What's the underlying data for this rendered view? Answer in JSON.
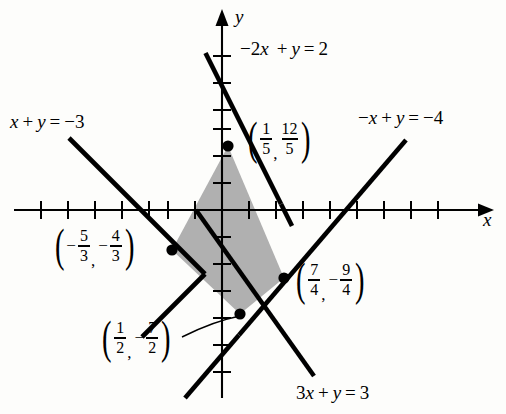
{
  "figure": {
    "type": "linear-inequality-region",
    "axes": {
      "x_label": "x",
      "y_label": "y",
      "origin_px": [
        222,
        210
      ],
      "px_per_unit": 27,
      "x_range": [
        -8.2,
        10.2
      ],
      "y_range": [
        -7.4,
        7.3
      ],
      "tick_spacing": 1,
      "x_ticks": [
        -7,
        -6,
        -5,
        -4,
        -3,
        -2,
        -1,
        1,
        2,
        3,
        4,
        5,
        6,
        7
      ],
      "y_ticks": [
        -7,
        -6,
        -5,
        -4,
        -3,
        -2,
        -1,
        1,
        2,
        3,
        4,
        5,
        6
      ],
      "grid": false,
      "arrowheads": [
        "x-positive",
        "y-positive"
      ]
    },
    "lines": [
      {
        "id": "line-minus2x-plus-y",
        "equation_text": "-2x + y = 2",
        "parts": [
          "−",
          "2",
          "x",
          "+",
          "y",
          "=",
          "2"
        ],
        "a": -2,
        "b": 1,
        "c": 2,
        "slope": 2,
        "intercept": 2,
        "label_position": "top-center"
      },
      {
        "id": "line-x-plus-y",
        "equation_text": "x + y = -3",
        "parts": [
          "x",
          "+",
          "y",
          "=",
          "−3"
        ],
        "a": 1,
        "b": 1,
        "c": -3,
        "slope": -1,
        "intercept": -3,
        "label_position": "upper-left"
      },
      {
        "id": "line-minusx-plus-y",
        "equation_text": "-x + y = -4",
        "parts": [
          "−",
          "x",
          "+",
          "y",
          "=",
          "−4"
        ],
        "a": -1,
        "b": 1,
        "c": -4,
        "slope": 1,
        "intercept": -4,
        "label_position": "upper-right"
      },
      {
        "id": "line-3x-plus-y",
        "equation_text": "3x + y = 3",
        "parts": [
          "3",
          "x",
          "+",
          "y",
          "=",
          "3"
        ],
        "a": 3,
        "b": 1,
        "c": 3,
        "slope": -3,
        "intercept": 3,
        "label_position": "bottom-right"
      }
    ],
    "vertices": [
      {
        "id": "vertex-top",
        "x": 0.2,
        "y": 2.4,
        "x_frac": {
          "sign": "",
          "num": "1",
          "den": "5"
        },
        "y_frac": {
          "sign": "",
          "num": "12",
          "den": "5"
        },
        "label_text": "(1/5, 12/5)",
        "px": [
          228,
          146
        ]
      },
      {
        "id": "vertex-left",
        "x": -1.6667,
        "y": -1.3333,
        "x_frac": {
          "sign": "−",
          "num": "5",
          "den": "3"
        },
        "y_frac": {
          "sign": "−",
          "num": "4",
          "den": "3"
        },
        "label_text": "(-5/3, -4/3)",
        "px": [
          172,
          250
        ]
      },
      {
        "id": "vertex-right",
        "x": 1.75,
        "y": -2.25,
        "x_frac": {
          "sign": "",
          "num": "7",
          "den": "4"
        },
        "y_frac": {
          "sign": "−",
          "num": "9",
          "den": "4"
        },
        "label_text": "(7/4, -9/4)",
        "px": [
          284,
          278
        ]
      },
      {
        "id": "vertex-bottom",
        "x": 0.5,
        "y": -3.5,
        "x_frac": {
          "sign": "",
          "num": "1",
          "den": "2"
        },
        "y_frac": {
          "sign": "−",
          "num": "7",
          "den": "2"
        },
        "label_text": "(1/2, -7/2)",
        "px": [
          240,
          314
        ],
        "has_leader_line": true
      }
    ],
    "shaded_region": {
      "id": "feasible-region",
      "fill_color": "#b0b0b0",
      "fill_style": "solid-gray",
      "vertex_ids": [
        "vertex-top",
        "vertex-right",
        "vertex-bottom",
        "vertex-left"
      ]
    },
    "colors": {
      "ink": "#000000",
      "background": "#fdfdfb",
      "shade": "#b0b0b0"
    }
  }
}
